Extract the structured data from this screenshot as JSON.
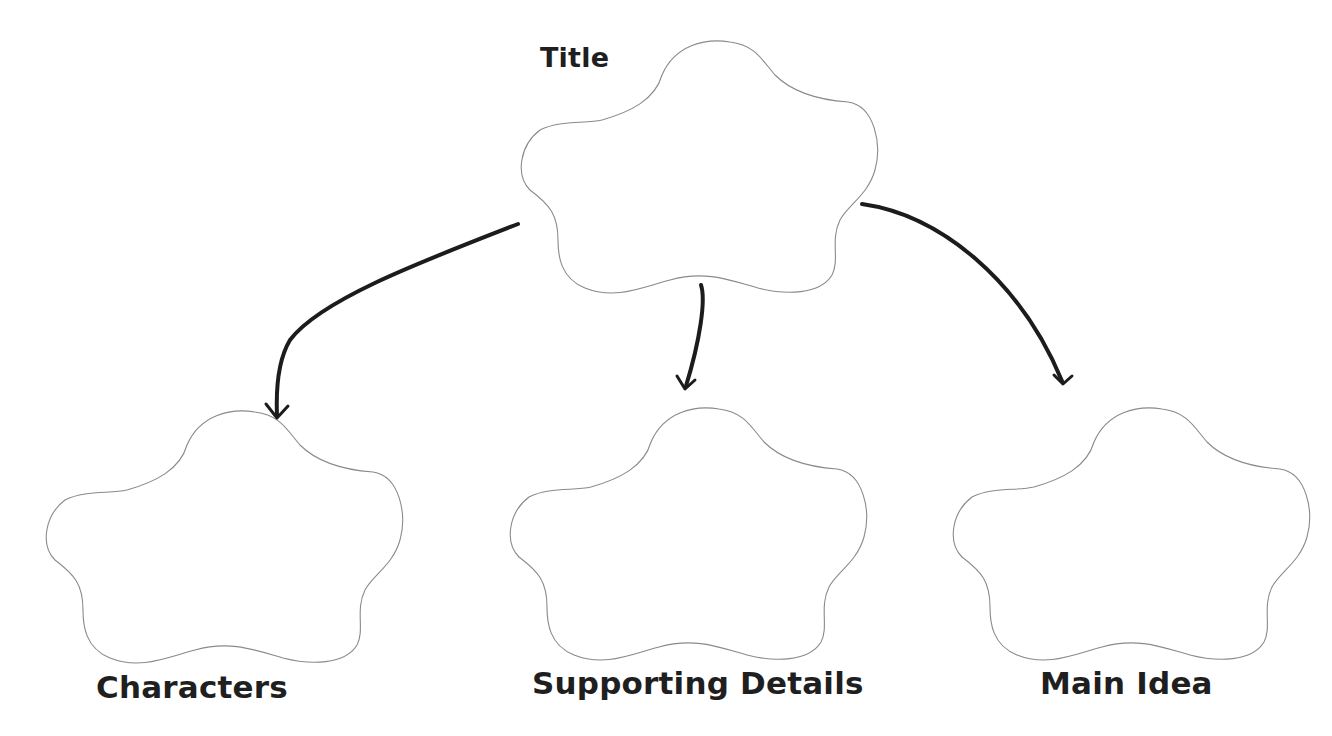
{
  "diagram": {
    "type": "graphic-organizer",
    "nodes": [
      {
        "id": "title",
        "label": "Title",
        "position": "top-center",
        "shape": "cloud",
        "content": ""
      },
      {
        "id": "characters",
        "label": "Characters",
        "position": "bottom-left",
        "shape": "cloud",
        "content": ""
      },
      {
        "id": "supporting_details",
        "label": "Supporting Details",
        "position": "bottom-center",
        "shape": "cloud",
        "content": ""
      },
      {
        "id": "main_idea",
        "label": "Main Idea",
        "position": "bottom-right",
        "shape": "cloud",
        "content": ""
      }
    ],
    "edges": [
      {
        "from": "title",
        "to": "characters"
      },
      {
        "from": "title",
        "to": "supporting_details"
      },
      {
        "from": "title",
        "to": "main_idea"
      }
    ],
    "colors": {
      "background": "#ffffff",
      "cloud_outline": "#8a8a8a",
      "arrow": "#1c1c1c",
      "text": "#1f1f1f"
    }
  }
}
